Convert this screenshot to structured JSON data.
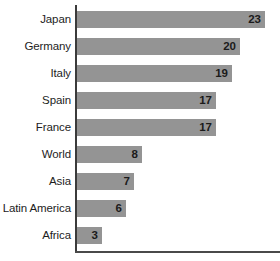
{
  "chart_data": {
    "type": "bar",
    "orientation": "horizontal",
    "title": "",
    "subtitle": "",
    "xlabel": "",
    "ylabel": "",
    "xlim": [
      0,
      25
    ],
    "grid": false,
    "legend": null,
    "bar_color": "#949494",
    "axis_color": "#3b3b3b",
    "text_color": "#1d1d1d",
    "background": "#ffffff",
    "categories": [
      "Japan",
      "Germany",
      "Italy",
      "Spain",
      "France",
      "World",
      "Asia",
      "Latin America",
      "Africa"
    ],
    "values": [
      23,
      20,
      19,
      17,
      17,
      8,
      7,
      6,
      3
    ],
    "value_labels": [
      "23",
      "20",
      "19",
      "17",
      "17",
      "8",
      "7",
      "6",
      "3"
    ],
    "points": [
      {
        "category": "Japan",
        "value": 23,
        "label": "23"
      },
      {
        "category": "Germany",
        "value": 20,
        "label": "20"
      },
      {
        "category": "Italy",
        "value": 19,
        "label": "19"
      },
      {
        "category": "Spain",
        "value": 17,
        "label": "17"
      },
      {
        "category": "France",
        "value": 17,
        "label": "17"
      },
      {
        "category": "World",
        "value": 8,
        "label": "8"
      },
      {
        "category": "Asia",
        "value": 7,
        "label": "7"
      },
      {
        "category": "Latin America",
        "value": 6,
        "label": "6"
      },
      {
        "category": "Africa",
        "value": 3,
        "label": "3"
      }
    ]
  }
}
